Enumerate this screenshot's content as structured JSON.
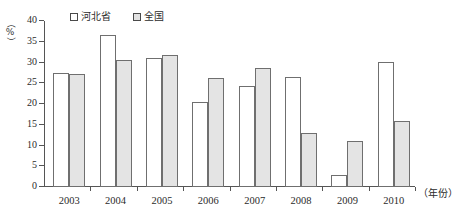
{
  "chart_data": {
    "type": "bar",
    "title": "",
    "subtitle": "",
    "xlabel": "（年份）",
    "ylabel": "（%）",
    "ylim": [
      0,
      40
    ],
    "yticks": [
      0,
      5,
      10,
      15,
      20,
      25,
      30,
      35,
      40
    ],
    "grid": false,
    "legend_position": "top-center",
    "categories": [
      "2003",
      "2004",
      "2005",
      "2006",
      "2007",
      "2008",
      "2009",
      "2010"
    ],
    "series": [
      {
        "name": "河北省",
        "color": "#ffffff",
        "values": [
          27.5,
          36.6,
          31.0,
          20.5,
          24.3,
          26.6,
          3.0,
          30.1
        ]
      },
      {
        "name": "全国",
        "color": "#e4e4e4",
        "values": [
          27.2,
          30.7,
          31.9,
          26.3,
          28.7,
          12.9,
          11.0,
          15.8
        ]
      }
    ]
  },
  "legend": {
    "entries": [
      {
        "label": "河北省",
        "swatch": "legend-swatch-hebei"
      },
      {
        "label": "全国",
        "swatch": "legend-swatch-national"
      }
    ]
  },
  "axes": {
    "y_title_percent": "%",
    "y_paren_open": "（",
    "y_paren_close": "）",
    "x_title": "（年份）"
  }
}
